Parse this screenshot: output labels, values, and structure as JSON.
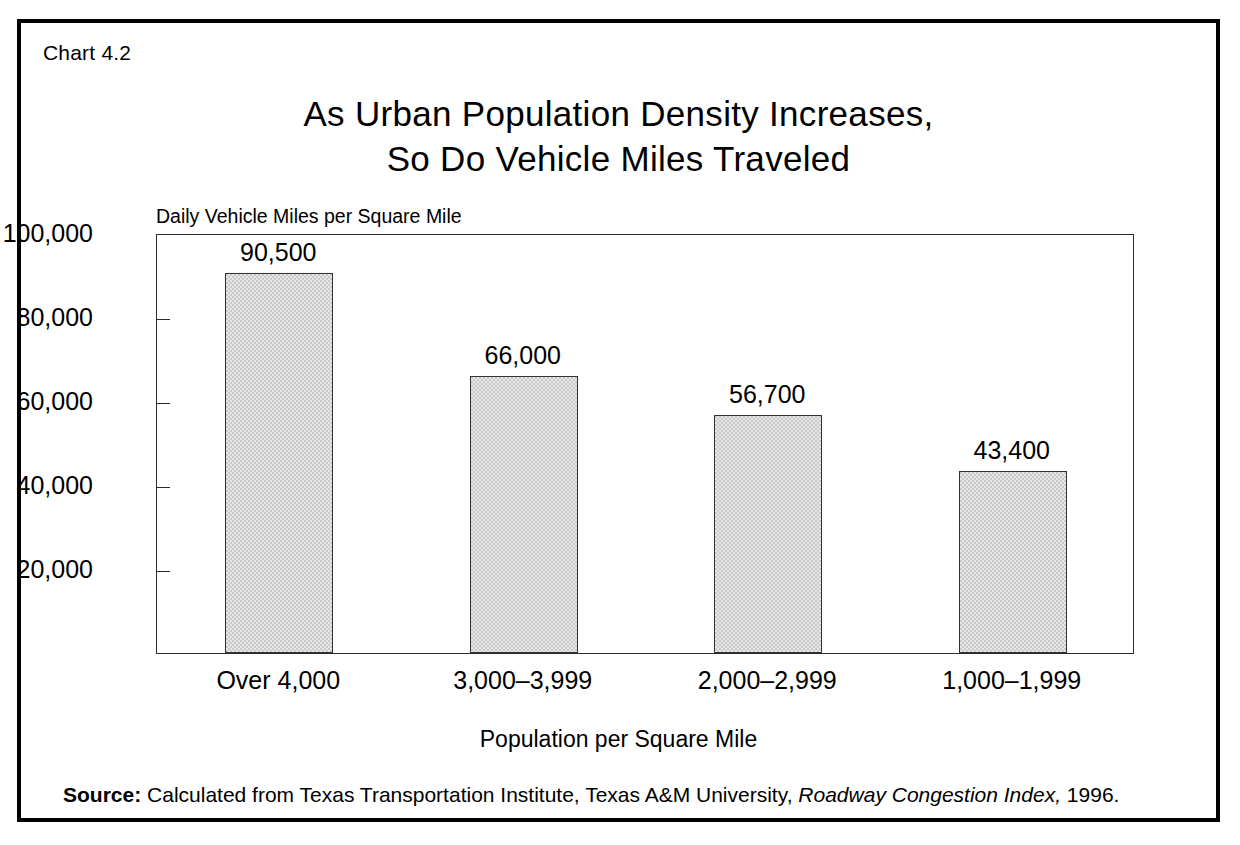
{
  "figure": {
    "chart_number": "Chart 4.2",
    "title_line1": "As Urban Population Density Increases,",
    "title_line2": "So Do Vehicle Miles Traveled",
    "source": {
      "label": "Source:",
      "text_before": "Calculated from Texas Transportation Institute, Texas A&M University,",
      "italic_title": "Roadway Congestion Index,",
      "text_after": "1996."
    },
    "colors": {
      "border": "#000000",
      "bar_fill": "#c9c9c9",
      "bar_edge": "#333333",
      "axis": "#2b2b2b",
      "text": "#000000",
      "background": "#ffffff"
    }
  },
  "chart_data": {
    "type": "bar",
    "title": "As Urban Population Density Increases, So Do Vehicle Miles Traveled",
    "subtitle": "",
    "xlabel": "Population per Square Mile",
    "ylabel": "Daily Vehicle Miles per Square Mile",
    "categories": [
      "Over 4,000",
      "3,000–3,999",
      "2,000–2,999",
      "1,000–1,999"
    ],
    "values": [
      90500,
      66000,
      56700,
      43400
    ],
    "value_labels": [
      "90,500",
      "66,000",
      "56,700",
      "43,400"
    ],
    "ylim": [
      0,
      100000
    ],
    "ytick_values": [
      20000,
      40000,
      60000,
      80000,
      100000
    ],
    "ytick_labels": [
      "20,000",
      "40,000",
      "60,000",
      "80,000",
      "100,000"
    ],
    "grid": false,
    "legend": false,
    "legend_position": "none",
    "annotations": []
  }
}
